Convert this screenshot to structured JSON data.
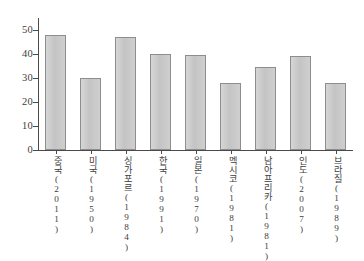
{
  "chart_data": {
    "type": "bar",
    "title": "",
    "subtitle": "",
    "xlabel": "",
    "ylabel": "",
    "categories": [
      "중국(2011)",
      "미국(1950)",
      "싱가포르(1984)",
      "한국(1991)",
      "일본(1970)",
      "멕시코(1981)",
      "남아프리카(1981)",
      "인도(2007)",
      "브라질(1989)"
    ],
    "values": [
      48,
      30,
      47,
      40,
      39.5,
      28,
      34.5,
      39,
      28
    ],
    "ylim": [
      0,
      55
    ],
    "yticks": [
      0,
      10,
      20,
      30,
      40,
      50
    ],
    "ytick_labels": [
      "0",
      "10",
      "20",
      "30",
      "40",
      "50"
    ],
    "grid": false,
    "legend": false,
    "legend_position": "none",
    "bar_color": "#c9c9c9",
    "bar_border_color": "#8d8d8d",
    "axis_color": "#4a4a4a",
    "background_color": "#ffffff"
  }
}
